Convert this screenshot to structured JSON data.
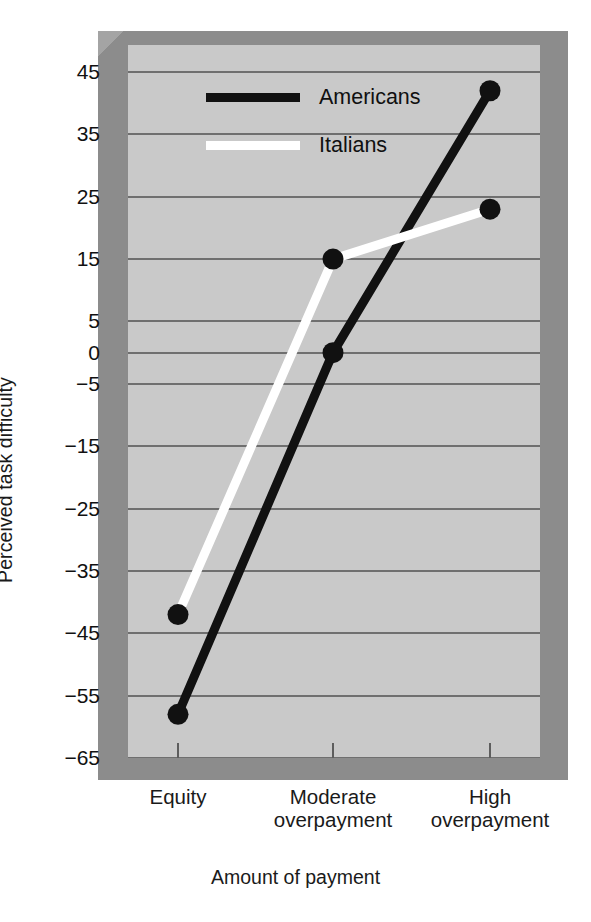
{
  "chart_data": {
    "type": "line",
    "title": "",
    "xlabel": "Amount of payment",
    "ylabel": "Perceived task difficulty",
    "categories": [
      "Equity",
      "Moderate\noverpayment",
      "High\noverpayment"
    ],
    "ylim": [
      -65,
      45
    ],
    "yticks": [
      45,
      35,
      25,
      15,
      5,
      0,
      -5,
      -15,
      -25,
      -35,
      -45,
      -55,
      -65
    ],
    "ytick_labels": [
      "45",
      "35",
      "25",
      "15",
      "5",
      "0",
      "−5",
      "−15",
      "−25",
      "−35",
      "−45",
      "−55",
      "−65"
    ],
    "grid": true,
    "legend_position": "top-center",
    "series": [
      {
        "name": "Americans",
        "color": "#111111",
        "values": [
          -58,
          0,
          42
        ]
      },
      {
        "name": "Italians",
        "color": "#ffffff",
        "values": [
          -42,
          15,
          23
        ]
      }
    ]
  },
  "legend": {
    "entries": [
      {
        "label": "Americans",
        "color": "#111111"
      },
      {
        "label": "Italians",
        "color": "#ffffff"
      }
    ]
  },
  "axes": {
    "y_title": "Perceived task difficulty",
    "x_title": "Amount of payment",
    "x_categories": [
      {
        "line1": "Equity",
        "line2": ""
      },
      {
        "line1": "Moderate",
        "line2": "overpayment"
      },
      {
        "line1": "High",
        "line2": "overpayment"
      }
    ]
  },
  "colors": {
    "plot_background": "#c9c9c9",
    "frame": "#8c8c8c",
    "gridline": "#6f6f6f",
    "americans": "#111111",
    "italians": "#ffffff",
    "text": "#1a1a1a",
    "page_background": "#ffffff"
  }
}
